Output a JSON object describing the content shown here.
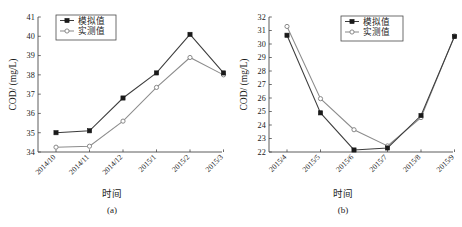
{
  "figure": {
    "background": "#ffffff",
    "panel_count": 2
  },
  "colors": {
    "simulated": "#1a1a1a",
    "measured": "#8c8c8c",
    "axis": "#4a4a4a",
    "text": "#1a1a1a"
  },
  "chart_data": [
    {
      "type": "line",
      "id": "panel-a",
      "caption": "(a)",
      "title": "",
      "xlabel": "时间",
      "ylabel": "COD/ (mg/L)",
      "categories": [
        "2014/10",
        "2014/11",
        "2014/12",
        "2015/1",
        "2015/2",
        "2015/3"
      ],
      "ylim": [
        34,
        41
      ],
      "yticks": [
        34,
        35,
        36,
        37,
        38,
        39,
        40,
        41
      ],
      "ytick_labels": [
        "34",
        "35",
        "36",
        "37",
        "38",
        "39",
        "40",
        "41"
      ],
      "grid": false,
      "legend_position": "top-left",
      "series": [
        {
          "name": "模拟值",
          "marker": "filled-square",
          "color": "#1a1a1a",
          "values": [
            35.0,
            35.1,
            36.8,
            38.1,
            40.1,
            38.1
          ]
        },
        {
          "name": "实测值",
          "marker": "open-circle",
          "color": "#8c8c8c",
          "values": [
            34.25,
            34.3,
            35.6,
            37.35,
            38.9,
            38.0
          ]
        }
      ]
    },
    {
      "type": "line",
      "id": "panel-b",
      "caption": "(b)",
      "title": "",
      "xlabel": "时间",
      "ylabel": "COD/ (mg/L)",
      "categories": [
        "2015/4",
        "2015/5",
        "2015/6",
        "2015/7",
        "2015/8",
        "2015/9"
      ],
      "ylim": [
        22,
        32
      ],
      "yticks": [
        22,
        23,
        24,
        25,
        26,
        27,
        28,
        29,
        30,
        31,
        32
      ],
      "ytick_labels": [
        "22",
        "23",
        "24",
        "25",
        "26",
        "27",
        "28",
        "29",
        "30",
        "31",
        "32"
      ],
      "grid": false,
      "legend_position": "top-right",
      "series": [
        {
          "name": "模拟值",
          "marker": "filled-square",
          "color": "#1a1a1a",
          "values": [
            30.65,
            24.9,
            22.15,
            22.3,
            24.7,
            30.55
          ]
        },
        {
          "name": "实测值",
          "marker": "open-circle",
          "color": "#8c8c8c",
          "values": [
            31.3,
            25.95,
            23.65,
            22.45,
            24.55,
            30.6
          ]
        }
      ]
    }
  ]
}
